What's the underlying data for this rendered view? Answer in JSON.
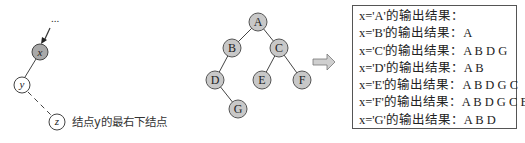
{
  "left_diagram": {
    "ellipsis": "...",
    "nodes": [
      {
        "id": "x",
        "label": "x",
        "filled": true
      },
      {
        "id": "y",
        "label": "y",
        "filled": false
      },
      {
        "id": "z",
        "label": "z",
        "filled": false
      }
    ],
    "annotation": "结点y的最右下结点"
  },
  "tree": {
    "nodes": [
      {
        "label": "A"
      },
      {
        "label": "B"
      },
      {
        "label": "C"
      },
      {
        "label": "D"
      },
      {
        "label": "E"
      },
      {
        "label": "F"
      },
      {
        "label": "G"
      }
    ],
    "edges": [
      [
        "A",
        "B"
      ],
      [
        "A",
        "C"
      ],
      [
        "B",
        "D"
      ],
      [
        "C",
        "E"
      ],
      [
        "C",
        "F"
      ],
      [
        "D",
        "G"
      ]
    ],
    "node_fill": "#c8c8c8",
    "node_stroke": "#555555"
  },
  "arrow": {
    "direction": "right",
    "fill": "#cfcfcf"
  },
  "results": {
    "lines": [
      "x='A'的输出结果：",
      "x='B'的输出结果：A",
      "x='C'的输出结果：A B D G",
      "x='D'的输出结果：A B",
      "x='E'的输出结果：A B D G C",
      "x='F'的输出结果：A B D G C E",
      "x='G'的输出结果：A B D"
    ]
  }
}
